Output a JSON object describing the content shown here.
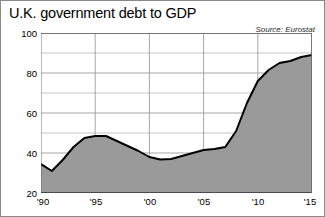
{
  "chart_data": {
    "type": "area",
    "title": "U.K. government debt to GDP",
    "source": "Source: Eurostat",
    "xlabel": "",
    "ylabel": "",
    "xlim": [
      1990,
      2015
    ],
    "ylim": [
      20,
      100
    ],
    "y_ticks": [
      20,
      40,
      60,
      80,
      100
    ],
    "y_tick_labels": [
      "20",
      "40",
      "60",
      "80",
      "100"
    ],
    "y_minor_ticks": [
      30,
      50,
      70,
      90
    ],
    "x_ticks": [
      1990,
      1995,
      2000,
      2005,
      2010,
      2015
    ],
    "x_tick_labels": [
      "'90",
      "'95",
      "'00",
      "'05",
      "'10",
      "'15"
    ],
    "grid": true,
    "legend": "none",
    "series": [
      {
        "name": "U.K. government debt to GDP",
        "x": [
          1990,
          1991,
          1992,
          1993,
          1994,
          1995,
          1996,
          1997,
          1998,
          1999,
          2000,
          2001,
          2002,
          2003,
          2004,
          2005,
          2006,
          2007,
          2008,
          2009,
          2010,
          2011,
          2012,
          2013,
          2014,
          2015
        ],
        "values": [
          34.5,
          31.0,
          36.5,
          43.0,
          47.5,
          48.5,
          48.5,
          46.0,
          43.5,
          41.0,
          38.0,
          36.8,
          37.0,
          38.5,
          40.0,
          41.5,
          42.0,
          43.0,
          51.0,
          65.0,
          76.0,
          81.5,
          85.0,
          86.0,
          88.0,
          89.0
        ]
      }
    ],
    "colors": {
      "area_fill": "#9a9a9a",
      "line": "#000000",
      "grid": "#9d9d9d",
      "border": "#8a8a8a",
      "background": "#ffffff",
      "text": "#000000"
    }
  }
}
